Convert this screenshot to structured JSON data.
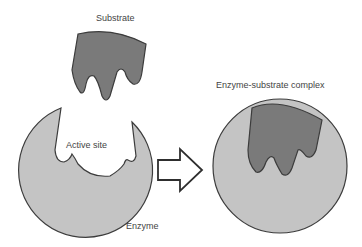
{
  "diagram": {
    "type": "lock-and-key enzyme model",
    "labels": {
      "substrate": "Substrate",
      "active_site": "Active site",
      "enzyme": "Enzyme",
      "complex": "Enzyme-substrate complex"
    },
    "colors": {
      "substrate_fill": "#7a7a7a",
      "enzyme_fill": "#c4c4c4",
      "outline": "#3c3c3c",
      "arrow_fill": "#ffffff",
      "text": "#444444",
      "background": "#ffffff"
    }
  }
}
